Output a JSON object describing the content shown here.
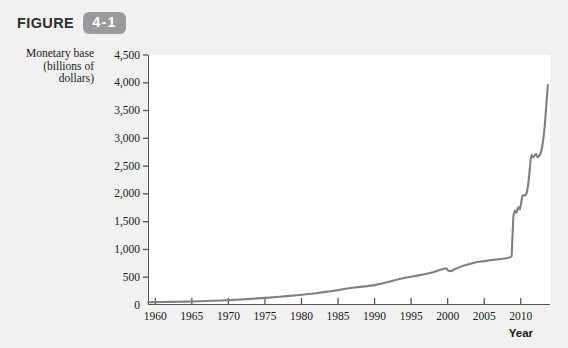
{
  "figure": {
    "label": "FIGURE",
    "number": "4-1"
  },
  "colors": {
    "card_background": "#f1f1f1",
    "plot_background": "#ffffff",
    "badge": "#9a9a9a",
    "line": "#808080",
    "axis": "#555555",
    "text": "#1a1a1a"
  },
  "chart_data": {
    "type": "line",
    "title": "",
    "ylabel": "Monetary base (billions of dollars)",
    "ylabel_lines": [
      "Monetary base",
      "(billions of",
      "dollars)"
    ],
    "xlabel": "Year",
    "xlim": [
      1959,
      2014
    ],
    "ylim": [
      0,
      4500
    ],
    "grid": false,
    "legend": null,
    "ytick_labels": [
      "0",
      "500",
      "1,000",
      "1,500",
      "2,000",
      "2,500",
      "3,000",
      "3,500",
      "4,000",
      "4,500"
    ],
    "yticks": [
      0,
      500,
      1000,
      1500,
      2000,
      2500,
      3000,
      3500,
      4000,
      4500
    ],
    "xtick_labels": [
      "1960",
      "1965",
      "1970",
      "1975",
      "1980",
      "1985",
      "1990",
      "1995",
      "2000",
      "2005",
      "2010"
    ],
    "xticks": [
      1960,
      1965,
      1970,
      1975,
      1980,
      1985,
      1990,
      1995,
      2000,
      2005,
      2010
    ],
    "series": [
      {
        "name": "Monetary base",
        "x": [
          1959,
          1960,
          1961,
          1962,
          1963,
          1964,
          1965,
          1966,
          1967,
          1968,
          1969,
          1970,
          1971,
          1972,
          1973,
          1974,
          1975,
          1976,
          1977,
          1978,
          1979,
          1980,
          1981,
          1982,
          1983,
          1984,
          1985,
          1986,
          1987,
          1988,
          1989,
          1990,
          1991,
          1992,
          1993,
          1994,
          1995,
          1996,
          1997,
          1998,
          1999,
          1999.8,
          2000.1,
          2000.5,
          2001,
          2002,
          2003,
          2004,
          2005,
          2006,
          2007,
          2008,
          2008.5,
          2008.75,
          2008.85,
          2009.0,
          2009.2,
          2009.4,
          2009.55,
          2009.7,
          2009.85,
          2010.0,
          2010.2,
          2010.4,
          2010.6,
          2010.8,
          2011.0,
          2011.2,
          2011.35,
          2011.5,
          2011.7,
          2011.9,
          2012.1,
          2012.3,
          2012.5,
          2012.7,
          2012.9,
          2013.1,
          2013.3,
          2013.5,
          2013.7
        ],
        "y": [
          50,
          52,
          54,
          56,
          58,
          61,
          64,
          67,
          71,
          76,
          81,
          87,
          94,
          101,
          110,
          120,
          128,
          137,
          148,
          160,
          172,
          185,
          198,
          213,
          232,
          248,
          268,
          293,
          310,
          326,
          340,
          358,
          387,
          417,
          453,
          485,
          508,
          533,
          558,
          589,
          634,
          660,
          618,
          610,
          648,
          700,
          740,
          775,
          790,
          810,
          825,
          840,
          855,
          880,
          1180,
          1620,
          1700,
          1660,
          1730,
          1760,
          1720,
          1790,
          1960,
          1980,
          1970,
          2010,
          2150,
          2400,
          2620,
          2700,
          2660,
          2690,
          2720,
          2660,
          2680,
          2720,
          2820,
          3000,
          3250,
          3600,
          3960
        ],
        "color": "#808080"
      }
    ]
  }
}
